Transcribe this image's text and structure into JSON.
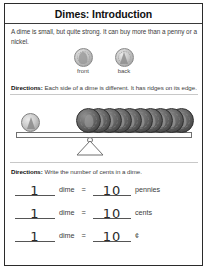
{
  "worksheet": {
    "title": "Dimes: Introduction",
    "intro": "A dime is small, but quite strong. It can buy more than a penny or a nickel.",
    "coins": [
      {
        "label": "front",
        "icon": "dime-front-icon"
      },
      {
        "label": "back",
        "icon": "dime-back-icon"
      }
    ],
    "directions_1_label": "Directions:",
    "directions_1_text": " Each side of a dime is different. It has ridges on its edge.",
    "directions_2_label": "Directions:",
    "directions_2_text": " Write the number of cents in a dime.",
    "scale": {
      "left_coin_count": 1,
      "left_coin_name": "dime",
      "right_coin_count": 10,
      "right_coin_name": "pennies"
    },
    "answer_rows": [
      {
        "count": "1",
        "left_unit": "dime",
        "equals": "=",
        "value": "10",
        "right_unit": "pennies"
      },
      {
        "count": "1",
        "left_unit": "dime",
        "equals": "=",
        "value": "10",
        "right_unit": "cents"
      },
      {
        "count": "1",
        "left_unit": "dime",
        "equals": "=",
        "value": "10",
        "right_unit": "¢"
      }
    ]
  },
  "colors": {
    "frame": "#2b2b2b",
    "text": "#3d3d3d",
    "heading": "#111111",
    "rule": "#c8c8c8",
    "penny": "#4f4f4f",
    "dime": "#cccccc"
  }
}
